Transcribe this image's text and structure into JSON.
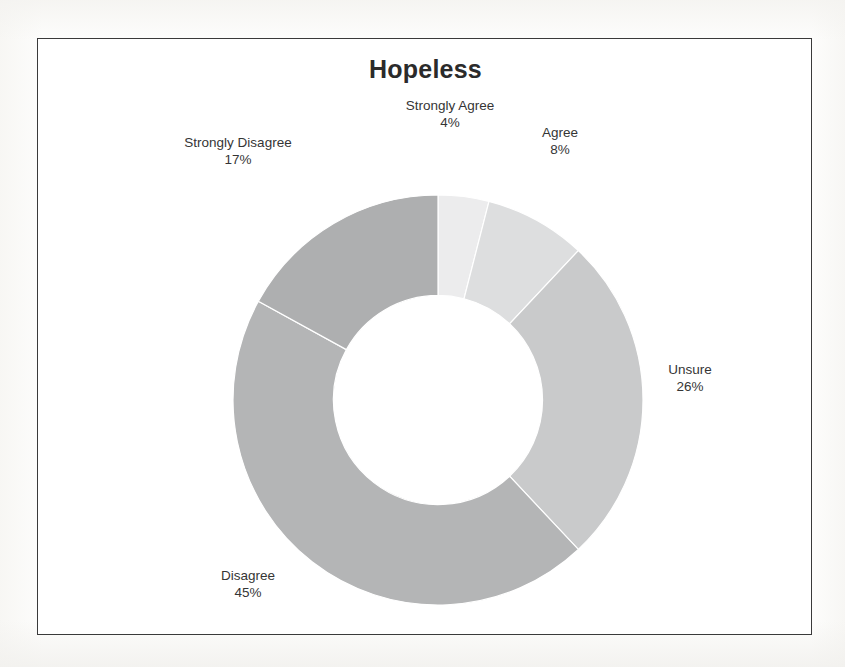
{
  "chart_data": {
    "type": "pie",
    "variant": "donut",
    "title": "Hopeless",
    "xlabel": "",
    "ylabel": "",
    "legend": "none",
    "grid": false,
    "labels_on_slices": true,
    "unit": "%",
    "categories": [
      "Strongly Agree",
      "Agree",
      "Unsure",
      "Disagree",
      "Strongly Disagree"
    ],
    "values": [
      4,
      8,
      26,
      45,
      17
    ],
    "value_labels": [
      "4%",
      "8%",
      "26%",
      "45%",
      "17%"
    ],
    "colors": [
      "#ececed",
      "#dddedf",
      "#c9cacb",
      "#b4b5b6",
      "#aeafb0"
    ],
    "start_angle_deg": 0,
    "direction": "clockwise",
    "inner_radius_ratio": 0.51,
    "slices": [
      {
        "name": "Strongly Agree",
        "value": 4,
        "label": "Strongly Agree",
        "value_label": "4%",
        "color": "#ececed"
      },
      {
        "name": "Agree",
        "value": 8,
        "label": "Agree",
        "value_label": "8%",
        "color": "#dddedf"
      },
      {
        "name": "Unsure",
        "value": 26,
        "label": "Unsure",
        "value_label": "26%",
        "color": "#c9cacb"
      },
      {
        "name": "Disagree",
        "value": 45,
        "label": "Disagree",
        "value_label": "45%",
        "color": "#b4b5b6"
      },
      {
        "name": "Strongly Disagree",
        "value": 17,
        "label": "Strongly Disagree",
        "value_label": "17%",
        "color": "#aeafb0"
      }
    ]
  },
  "chart": {
    "title": "Hopeless",
    "frame_border_color": "#3a3a3a",
    "background": "#ffffff"
  },
  "labels": {
    "strongly_agree": {
      "name": "Strongly Agree",
      "value": "4%"
    },
    "agree": {
      "name": "Agree",
      "value": "8%"
    },
    "unsure": {
      "name": "Unsure",
      "value": "26%"
    },
    "disagree": {
      "name": "Disagree",
      "value": "45%"
    },
    "strongly_disagree": {
      "name": "Strongly Disagree",
      "value": "17%"
    }
  }
}
